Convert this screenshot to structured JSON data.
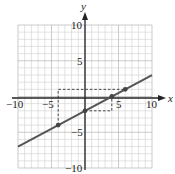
{
  "chart_data": {
    "type": "line",
    "title": "",
    "xlabel": "x",
    "ylabel": "y",
    "xlim": [
      -10,
      10
    ],
    "ylim": [
      -10,
      10
    ],
    "grid": true,
    "grid_step": 1,
    "x_ticks": [
      "-10",
      "-5",
      "5",
      "10"
    ],
    "y_ticks": [
      "10",
      "5",
      "-5",
      "-10"
    ],
    "series": [
      {
        "name": "line",
        "equation": "y = 0.5x - 2",
        "x": [
          -10,
          10
        ],
        "y": [
          -7,
          3
        ],
        "color": "#555555"
      }
    ],
    "points": [
      {
        "x": -4,
        "y": -4
      },
      {
        "x": 0,
        "y": -2
      },
      {
        "x": 4,
        "y": 0
      },
      {
        "x": 6,
        "y": 1
      }
    ],
    "dashed_guides": [
      {
        "from": [
          -4,
          -4
        ],
        "corner": [
          -4,
          1
        ],
        "to": [
          6,
          1
        ]
      },
      {
        "from": [
          0,
          -2
        ],
        "corner": [
          4,
          -2
        ],
        "to": [
          4,
          0
        ]
      }
    ]
  },
  "labels": {
    "x_axis": "x",
    "y_axis": "y",
    "xt_m10": "−10",
    "xt_m5": "−5",
    "xt_5": "5",
    "xt_10": "10",
    "yt_10": "10",
    "yt_5": "5",
    "yt_m5": "−5",
    "yt_m10": "−10"
  }
}
